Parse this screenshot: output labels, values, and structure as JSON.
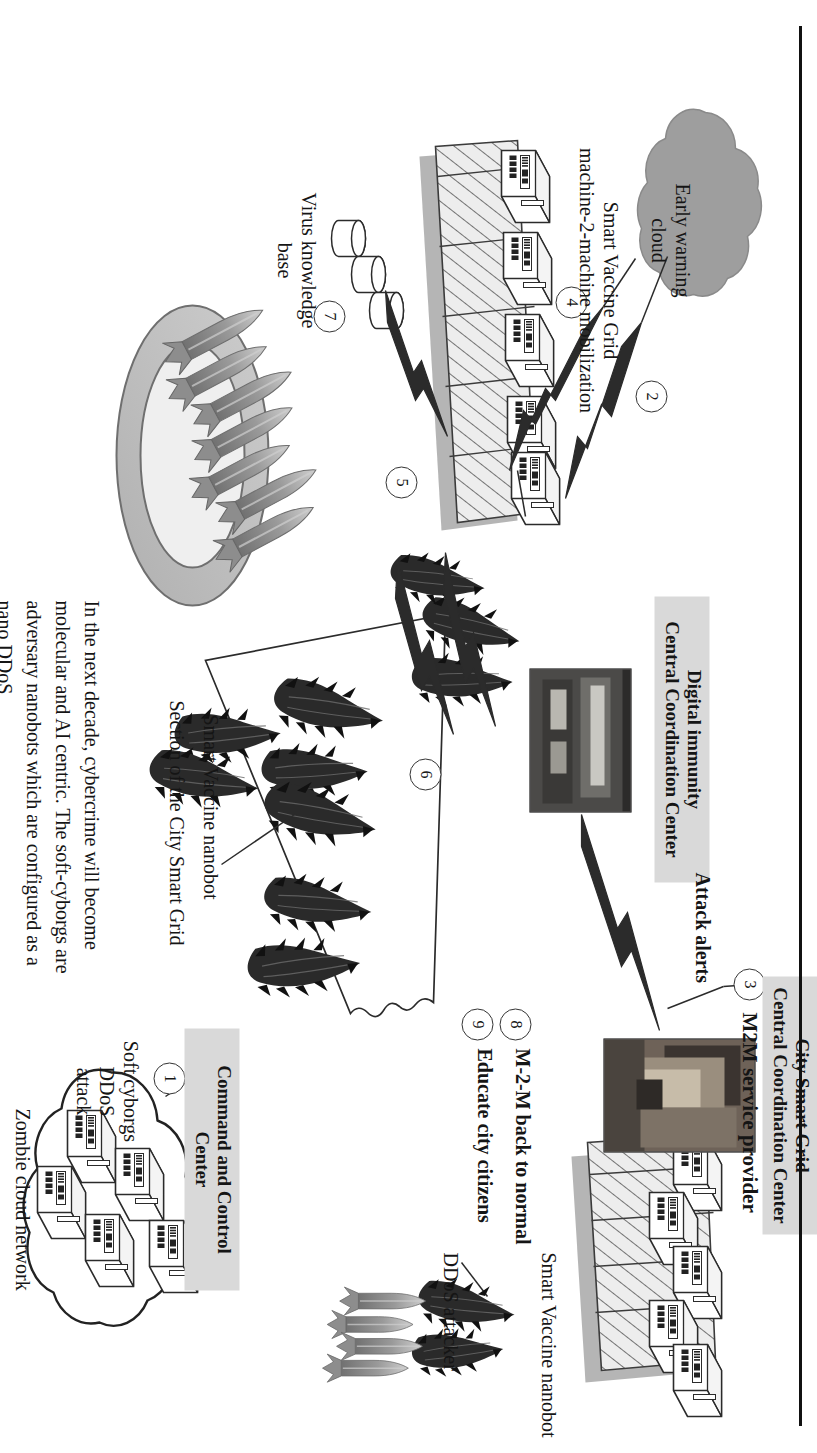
{
  "figure": {
    "title_note": "Smart Vaccine Grid digital immunity defense of a City Smart Grid against a soft-cyborg nano DDoS attack",
    "orientation": "rotated-90-ccw",
    "body_paragraph": "In the next decade, cybercrime will become molecular and AI centric. The soft-cyborgs are adversary nanobots which are configured as a nano DDoS",
    "edge_rule_color": "#111111"
  },
  "boxed_labels": [
    {
      "id": "city-smart-grid-cc",
      "text": "City Smart Grid\nCentral Coordination Center"
    },
    {
      "id": "digital-immunity-cc",
      "text": "Digital immunity\nCentral Coordination Center"
    },
    {
      "id": "command-and-control",
      "text": "Command and Control Center"
    }
  ],
  "plain_labels": [
    {
      "id": "m2m-service-provider",
      "text": "M2M service provider"
    },
    {
      "id": "attack-alerts",
      "text": "Attack alerts"
    },
    {
      "id": "early-warning-cloud",
      "text": "Early warning\ncloud"
    },
    {
      "id": "smart-vaccine-grid",
      "text": "Smart Vaccine Grid\nmachine-2-machine mobilization"
    },
    {
      "id": "virus-knowledge-base",
      "text": "Virus knowledge\nbase"
    },
    {
      "id": "smart-vaccine-nanobot-grid",
      "text": "Smart Vaccine nanobot"
    },
    {
      "id": "section-of-city-smart-grid",
      "text": "Section of the City Smart Grid"
    },
    {
      "id": "soft-cyborgs-ddos-attack",
      "text": "Soft cyborgs\nDDoS\nattack"
    },
    {
      "id": "zombie-cloud-network",
      "text": "Zombie cloud network"
    }
  ],
  "steps": [
    {
      "n": "1",
      "label": ""
    },
    {
      "n": "2",
      "label": ""
    },
    {
      "n": "3",
      "label": ""
    },
    {
      "n": "4",
      "label": ""
    },
    {
      "n": "5",
      "label": ""
    },
    {
      "n": "6",
      "label": ""
    },
    {
      "n": "7",
      "label": ""
    },
    {
      "n": "8",
      "label": "M-2-M back to normal"
    },
    {
      "n": "9",
      "label": "Educate city citizens"
    }
  ],
  "step_8_text": "M-2-M back to normal",
  "step_9_text": "Educate city citizens",
  "legend": [
    {
      "id": "legend-smart-vaccine-nanobot",
      "text": "Smart Vaccine nanobot",
      "icon": "worm-icon"
    },
    {
      "id": "legend-ddos-attacker",
      "text": "DDoS attacker",
      "icon": "rocket-icon"
    }
  ],
  "colors": {
    "shaded_label_bg": "#d9d9d9",
    "cloud_fill": "#9e9e9e",
    "slab_fill": "#e2e2e2",
    "slab_shadow": "#a8a8a8",
    "ring_outer": "#b9b9b9",
    "ring_inner": "#efefef",
    "rocket_body": "#9a9a9a",
    "worm_body": "#2b2b2b",
    "ink": "#151515"
  }
}
